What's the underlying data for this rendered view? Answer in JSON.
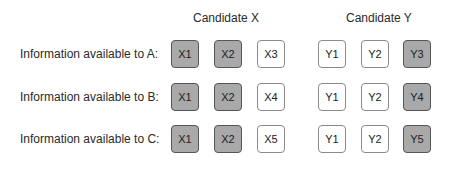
{
  "headers": {
    "candidate_x": "Candidate X",
    "candidate_y": "Candidate Y"
  },
  "rows": [
    {
      "label": "Information available to A:",
      "x": [
        {
          "text": "X1",
          "shaded": true
        },
        {
          "text": "X2",
          "shaded": true
        },
        {
          "text": "X3",
          "shaded": false
        }
      ],
      "y": [
        {
          "text": "Y1",
          "shaded": false
        },
        {
          "text": "Y2",
          "shaded": false
        },
        {
          "text": "Y3",
          "shaded": true
        }
      ]
    },
    {
      "label": "Information available to B:",
      "x": [
        {
          "text": "X1",
          "shaded": true
        },
        {
          "text": "X2",
          "shaded": true
        },
        {
          "text": "X4",
          "shaded": false
        }
      ],
      "y": [
        {
          "text": "Y1",
          "shaded": false
        },
        {
          "text": "Y2",
          "shaded": false
        },
        {
          "text": "Y4",
          "shaded": true
        }
      ]
    },
    {
      "label": "Information available to C:",
      "x": [
        {
          "text": "X1",
          "shaded": true
        },
        {
          "text": "X2",
          "shaded": true
        },
        {
          "text": "X5",
          "shaded": false
        }
      ],
      "y": [
        {
          "text": "Y1",
          "shaded": false
        },
        {
          "text": "Y2",
          "shaded": false
        },
        {
          "text": "Y5",
          "shaded": true
        }
      ]
    }
  ],
  "colors": {
    "shaded_fill": "#a9a9a9",
    "plain_fill": "#ffffff",
    "border": "#6a6a6a"
  }
}
